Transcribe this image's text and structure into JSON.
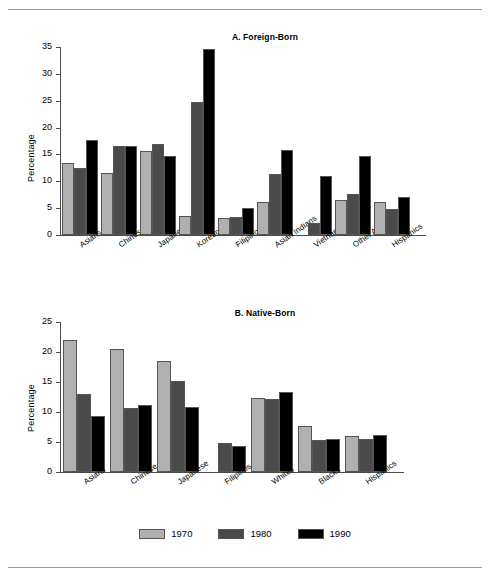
{
  "figure": {
    "top_rule": true,
    "bottom_rule": true
  },
  "legend": {
    "position": "bottom-center",
    "items": [
      {
        "label": "1970",
        "color": "#b0b0b0"
      },
      {
        "label": "1980",
        "color": "#4a4a4a"
      },
      {
        "label": "1990",
        "color": "#000000"
      }
    ]
  },
  "chart_data": [
    {
      "type": "bar",
      "title": "A. Foreign-Born",
      "xlabel": "",
      "ylabel": "Percentage",
      "ylim": [
        0,
        35
      ],
      "yticks": [
        0,
        5,
        10,
        15,
        20,
        25,
        30,
        35
      ],
      "grid": false,
      "legend_position": "figure-bottom-center",
      "categories": [
        "Asians",
        "Chinese",
        "Japanese",
        "Koreans",
        "Filipinos",
        "Asian Indians",
        "Vietnamese",
        "Other Asians",
        "Hispanics"
      ],
      "series": [
        {
          "name": "1970",
          "color": "#b0b0b0",
          "values": [
            13.4,
            11.5,
            15.7,
            3.5,
            3.2,
            6.2,
            null,
            6.6,
            6.2
          ]
        },
        {
          "name": "1980",
          "color": "#4a4a4a",
          "values": [
            12.5,
            16.5,
            16.9,
            24.7,
            3.3,
            11.4,
            2.3,
            7.6,
            4.8
          ]
        },
        {
          "name": "1990",
          "color": "#000000",
          "values": [
            17.6,
            16.6,
            14.7,
            34.6,
            5.0,
            15.8,
            11.0,
            14.7,
            7.1
          ]
        }
      ]
    },
    {
      "type": "bar",
      "title": "B. Native-Born",
      "xlabel": "",
      "ylabel": "Percentage",
      "ylim": [
        0,
        25
      ],
      "yticks": [
        0,
        5,
        10,
        15,
        20,
        25
      ],
      "grid": false,
      "legend_position": "figure-bottom-center",
      "categories": [
        "Asians",
        "Chinese",
        "Japanese",
        "Filipinos",
        "Whites",
        "Blacks",
        "Hispanics"
      ],
      "series": [
        {
          "name": "1970",
          "color": "#b0b0b0",
          "values": [
            22.0,
            20.5,
            18.5,
            null,
            12.3,
            7.6,
            6.0
          ]
        },
        {
          "name": "1980",
          "color": "#4a4a4a",
          "values": [
            13.0,
            10.6,
            15.1,
            4.9,
            12.2,
            5.3,
            5.5
          ]
        },
        {
          "name": "1990",
          "color": "#000000",
          "values": [
            9.4,
            11.1,
            10.8,
            4.3,
            13.4,
            5.5,
            6.2
          ]
        }
      ]
    }
  ]
}
